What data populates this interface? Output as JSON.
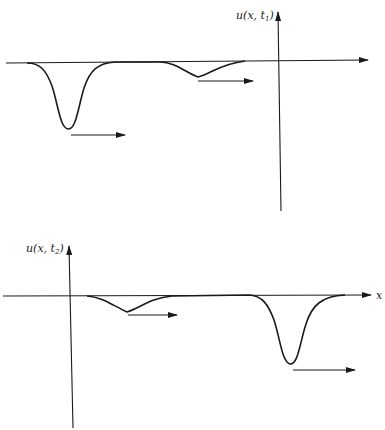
{
  "panels": [
    {
      "id": "t1",
      "y_axis_label_prefix": "u(x, t",
      "y_axis_label_subscript": "1",
      "y_axis_label_suffix": ")",
      "description": "Large soliton on left, small soliton on right, both moving right; vertical axis on the right"
    },
    {
      "id": "t2",
      "y_axis_label_prefix": "u(x, t",
      "y_axis_label_subscript": "2",
      "y_axis_label_suffix": ")",
      "x_axis_label": "x",
      "description": "Small soliton on left, large soliton on right (overtaken), both moving right; vertical axis on the left"
    }
  ],
  "colors": {
    "ink": "#1a1a1a",
    "background": "#ffffff"
  }
}
